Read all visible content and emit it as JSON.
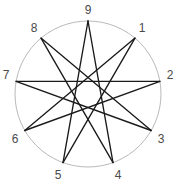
{
  "figure": {
    "title": "",
    "type": "star-polygon-diagram"
  },
  "chart_data": {
    "type": "diagram",
    "subtype": "star-polygon",
    "schlafli": "{9/4}",
    "title": "",
    "xlabel": "",
    "ylabel": "",
    "grid": false,
    "legend": null,
    "circle": {
      "cx": 88,
      "cy": 94,
      "r": 73,
      "stroke": "#b0b0b0",
      "stroke_width": 0.9,
      "fill": "none"
    },
    "vertex_count": 9,
    "step": 4,
    "line_color": "#1a1a1a",
    "line_width": 1.35,
    "label_color": "#4a4a4a",
    "vertices": [
      {
        "label": "1",
        "index": 1,
        "angle_deg": -50,
        "x": 135.0,
        "y": 38.1,
        "label_x": 142.0,
        "label_y": 28.0
      },
      {
        "label": "2",
        "index": 2,
        "angle_deg": -10,
        "x": 159.9,
        "y": 81.3,
        "label_x": 170.0,
        "label_y": 75.0
      },
      {
        "label": "3",
        "index": 3,
        "angle_deg": 30,
        "x": 151.2,
        "y": 130.5,
        "label_x": 161.0,
        "label_y": 139.0
      },
      {
        "label": "4",
        "index": 4,
        "angle_deg": 70,
        "x": 113.0,
        "y": 162.6,
        "label_x": 118.0,
        "label_y": 175.0
      },
      {
        "label": "5",
        "index": 5,
        "angle_deg": 110,
        "x": 63.0,
        "y": 162.6,
        "label_x": 58.0,
        "label_y": 175.0
      },
      {
        "label": "6",
        "index": 6,
        "angle_deg": 150,
        "x": 24.8,
        "y": 130.5,
        "label_x": 15.0,
        "label_y": 139.0
      },
      {
        "label": "7",
        "index": 7,
        "angle_deg": 190,
        "x": 16.1,
        "y": 81.3,
        "label_x": 6.0,
        "label_y": 75.0
      },
      {
        "label": "8",
        "index": 8,
        "angle_deg": 230,
        "x": 41.0,
        "y": 38.1,
        "label_x": 34.0,
        "label_y": 28.0
      },
      {
        "label": "9",
        "index": 9,
        "angle_deg": 270,
        "x": 88.0,
        "y": 21.0,
        "label_x": 88.0,
        "label_y": 10.0
      }
    ],
    "edges": [
      {
        "from": "9",
        "to": "4",
        "x1": 88.0,
        "y1": 21.0,
        "x2": 113.0,
        "y2": 162.6
      },
      {
        "from": "4",
        "to": "8",
        "x1": 113.0,
        "y1": 162.6,
        "x2": 41.0,
        "y2": 38.1
      },
      {
        "from": "8",
        "to": "3",
        "x1": 41.0,
        "y1": 38.1,
        "x2": 151.2,
        "y2": 130.5
      },
      {
        "from": "3",
        "to": "7",
        "x1": 151.2,
        "y1": 130.5,
        "x2": 16.1,
        "y2": 81.3
      },
      {
        "from": "7",
        "to": "2",
        "x1": 16.1,
        "y1": 81.3,
        "x2": 159.9,
        "y2": 81.3
      },
      {
        "from": "2",
        "to": "6",
        "x1": 159.9,
        "y1": 81.3,
        "x2": 24.8,
        "y2": 130.5
      },
      {
        "from": "6",
        "to": "1",
        "x1": 24.8,
        "y1": 130.5,
        "x2": 135.0,
        "y2": 38.1
      },
      {
        "from": "1",
        "to": "5",
        "x1": 135.0,
        "y1": 38.1,
        "x2": 63.0,
        "y2": 162.6
      },
      {
        "from": "5",
        "to": "9",
        "x1": 63.0,
        "y1": 162.6,
        "x2": 88.0,
        "y2": 21.0
      }
    ]
  }
}
